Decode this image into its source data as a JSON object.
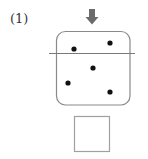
{
  "label": "(1)",
  "colors": {
    "arrow": "#6b6b6b",
    "box_stroke": "#8a8a8a",
    "line": "#7a7a7a",
    "dot": "#111111",
    "answer_box_stroke": "#a0a0a0"
  },
  "diagram": {
    "arrow": {
      "x": 92,
      "y_top": 9,
      "y_bottom": 24,
      "direction": "down"
    },
    "container": {
      "x": 56,
      "y": 31,
      "width": 74,
      "height": 74,
      "radius": 9
    },
    "cut_line": {
      "x1": 49,
      "x2": 135,
      "y": 53.5
    },
    "dots": [
      {
        "x": 74,
        "y": 49
      },
      {
        "x": 110,
        "y": 43
      },
      {
        "x": 93,
        "y": 68
      },
      {
        "x": 68,
        "y": 83
      },
      {
        "x": 110,
        "y": 92
      }
    ],
    "answer_box": {
      "x": 74.5,
      "y": 116.5,
      "width": 35,
      "height": 35
    }
  }
}
